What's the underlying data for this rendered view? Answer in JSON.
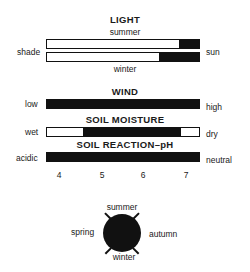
{
  "light": {
    "title": "LIGHT",
    "top_label": "summer",
    "bottom_label": "winter",
    "left_label": "shade",
    "right_label": "sun",
    "bars": [
      {
        "name": "summer",
        "fill_start_pct": 87,
        "fill_end_pct": 100
      },
      {
        "name": "winter",
        "fill_start_pct": 74,
        "fill_end_pct": 100
      }
    ]
  },
  "wind": {
    "title": "WIND",
    "left_label": "low",
    "right_label": "high",
    "fill_start_pct": 0,
    "fill_end_pct": 100
  },
  "soil_moisture": {
    "title": "SOIL MOISTURE",
    "left_label": "wet",
    "right_label": "dry",
    "fill_start_pct": 24,
    "fill_end_pct": 88
  },
  "soil_ph": {
    "title": "SOIL REACTION–pH",
    "left_label": "acidic",
    "right_label": "neutral",
    "fill_start_pct": 0,
    "fill_end_pct": 100,
    "ticks": [
      "4",
      "5",
      "6",
      "7"
    ]
  },
  "seasons": {
    "top": "summer",
    "bottom": "winter",
    "left": "spring",
    "right": "autumn"
  },
  "colors": {
    "fill": "#111111",
    "background": "#ffffff"
  }
}
